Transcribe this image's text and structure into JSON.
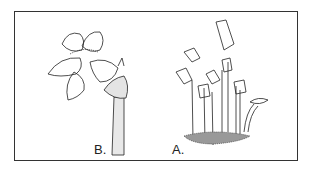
{
  "figure": {
    "panels": [
      {
        "label": "B.",
        "description": "single flower close-up on stippled stem"
      },
      {
        "label": "A.",
        "description": "cluster of flowering plants on ground"
      }
    ]
  }
}
